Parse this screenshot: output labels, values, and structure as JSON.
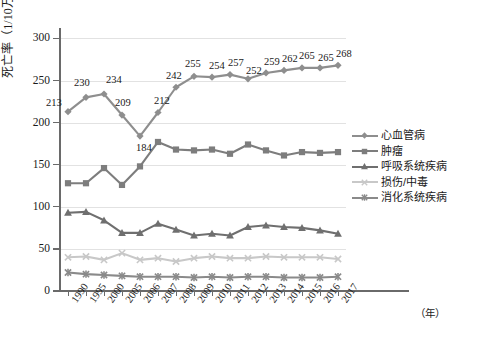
{
  "chart_data": {
    "type": "line",
    "title": "",
    "xlabel": "年",
    "ylabel": "死亡率（1/10万）",
    "x": [
      "1990",
      "1995",
      "2000",
      "2005",
      "2006",
      "2007",
      "2008",
      "2009",
      "2010",
      "2011",
      "2012",
      "2013",
      "2014",
      "2015",
      "2016",
      "2017"
    ],
    "ylim": [
      0,
      310
    ],
    "yticks": [
      0,
      50,
      100,
      150,
      200,
      250,
      300
    ],
    "grid": "horizontal",
    "legend_position": "right",
    "series": [
      {
        "name": "心血管病",
        "color": "#8e8e8e",
        "marker": "diamond",
        "labeled": true,
        "values": [
          213,
          230,
          234,
          209,
          184,
          212,
          242,
          255,
          254,
          257,
          252,
          259,
          262,
          265,
          265,
          268
        ]
      },
      {
        "name": "肿瘤",
        "color": "#7d7d7d",
        "marker": "square",
        "labeled": false,
        "values": [
          128,
          128,
          146,
          126,
          148,
          177,
          168,
          167,
          168,
          163,
          174,
          167,
          161,
          165,
          164,
          165
        ]
      },
      {
        "name": "呼吸系统疾病",
        "color": "#6f6f6f",
        "marker": "triangle",
        "labeled": false,
        "values": [
          93,
          94,
          84,
          69,
          69,
          80,
          73,
          66,
          68,
          66,
          76,
          78,
          76,
          75,
          72,
          68
        ]
      },
      {
        "name": "损伤/中毒",
        "color": "#c8c8c8",
        "marker": "cross",
        "labeled": false,
        "values": [
          40,
          41,
          37,
          45,
          37,
          39,
          35,
          39,
          41,
          39,
          39,
          41,
          40,
          40,
          40,
          38
        ]
      },
      {
        "name": "消化系统疾病",
        "color": "#8a8a8a",
        "marker": "star",
        "labeled": false,
        "values": [
          22,
          20,
          19,
          18,
          17,
          17,
          17,
          16,
          17,
          16,
          17,
          17,
          16,
          16,
          16,
          17
        ]
      }
    ]
  },
  "axes": {
    "y_tick_labels": [
      "300",
      "250",
      "200",
      "150",
      "100",
      "50",
      "0"
    ],
    "x_tick_labels": [
      "1990",
      "1995",
      "2000",
      "2005",
      "2006",
      "2007",
      "2008",
      "2009",
      "2010",
      "2011",
      "2012",
      "2013",
      "2014",
      "2015",
      "2016",
      "2017"
    ],
    "y_axis_title": "死亡率（1/10万）",
    "x_axis_unit": "（年）"
  },
  "legend": {
    "items": [
      {
        "label": "心血管病"
      },
      {
        "label": "肿瘤"
      },
      {
        "label": "呼吸系统疾病"
      },
      {
        "label": "损伤/中毒"
      },
      {
        "label": "消化系统疾病"
      }
    ]
  }
}
